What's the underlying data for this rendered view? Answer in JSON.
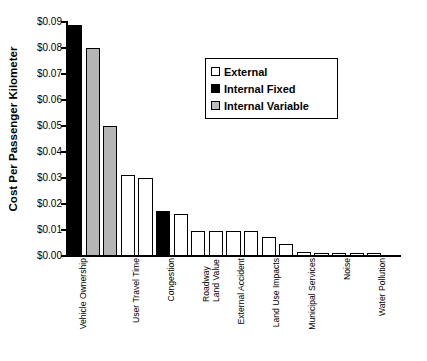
{
  "chart_data": {
    "type": "bar",
    "title": "",
    "xlabel": "",
    "ylabel": "Cost Per Passenger Kilometer",
    "ylim": [
      0,
      0.09
    ],
    "ytick_values": [
      0.09,
      0.08,
      0.07,
      0.06,
      0.05,
      0.04,
      0.03,
      0.02,
      0.01,
      0.0
    ],
    "ytick_labels": [
      "$0.09",
      "$0.08",
      "$0.07",
      "$0.06",
      "$0.05",
      "$0.04",
      "$0.03",
      "$0.02",
      "$0.01",
      "$0.00"
    ],
    "grid": false,
    "legend_position": "upper-center-right",
    "legend": [
      {
        "label": "External",
        "color": "#ffffff",
        "key": "external"
      },
      {
        "label": "Internal Fixed",
        "color": "#000000",
        "key": "fixed"
      },
      {
        "label": "Internal Variable",
        "color": "#b5b5b5",
        "key": "variable"
      }
    ],
    "categories": [
      "Vehicle Ownership",
      "User Travel Time",
      "Congestion",
      "Roadway Land Value",
      "External Accident",
      "Land Use Impacts",
      "Municipal Services",
      "Noise",
      "Water Pollution"
    ],
    "bars": [
      {
        "category": "Vehicle Ownership",
        "series": "Internal Fixed",
        "value": 0.089
      },
      {
        "category": "Vehicle Ownership",
        "series": "Internal Variable",
        "value": 0.08
      },
      {
        "category": "Vehicle Ownership",
        "series": "Internal Variable",
        "value": 0.05
      },
      {
        "category": "User Travel Time",
        "series": "External",
        "value": 0.031
      },
      {
        "category": "User Travel Time",
        "series": "External",
        "value": 0.03
      },
      {
        "category": "Congestion",
        "series": "Internal Fixed",
        "value": 0.0175
      },
      {
        "category": "Congestion",
        "series": "External",
        "value": 0.0163
      },
      {
        "category": "Roadway Land Value",
        "series": "External",
        "value": 0.0098
      },
      {
        "category": "Roadway Land Value",
        "series": "External",
        "value": 0.0098
      },
      {
        "category": "External Accident",
        "series": "External",
        "value": 0.0098
      },
      {
        "category": "External Accident",
        "series": "External",
        "value": 0.0098
      },
      {
        "category": "Land Use Impacts",
        "series": "External",
        "value": 0.0075
      },
      {
        "category": "Land Use Impacts",
        "series": "External",
        "value": 0.0048
      },
      {
        "category": "Municipal Services",
        "series": "External",
        "value": 0.0015
      },
      {
        "category": "Municipal Services",
        "series": "External",
        "value": 0.0013
      },
      {
        "category": "Noise",
        "series": "External",
        "value": 0.0013
      },
      {
        "category": "Noise",
        "series": "External",
        "value": 0.0012
      },
      {
        "category": "Water Pollution",
        "series": "External",
        "value": 0.001
      }
    ]
  },
  "axis": {
    "y_title": "Cost Per Passenger Kilometer"
  }
}
